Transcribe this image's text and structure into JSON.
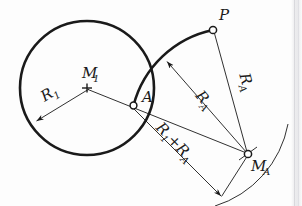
{
  "diagram": {
    "background_color": "#fdfdfd",
    "ink_color": "#1a1a1a",
    "labels": {
      "center_circle": {
        "base": "M",
        "sub": "1"
      },
      "radius_circle": {
        "base": "R",
        "sub": "1"
      },
      "point_tangency": {
        "base": "A",
        "sub": ""
      },
      "point_target": {
        "base": "P",
        "sub": ""
      },
      "center_arc": {
        "base": "M",
        "sub": "A"
      },
      "radius_arc_1": {
        "base": "R",
        "sub": "A"
      },
      "radius_arc_2": {
        "base": "R",
        "sub": "A"
      },
      "sum_radius": {
        "part1_base": "R",
        "part1_sub": "1",
        "operator": "+",
        "part2_base": "R",
        "part2_sub": "A"
      }
    },
    "geometry": {
      "circle": {
        "cx": 87,
        "cy": 88,
        "r": 67,
        "stroke_width": 2.6
      },
      "center_marker": {
        "x": 87,
        "y": 88
      },
      "point_a": {
        "x": 133.5,
        "y": 105.5,
        "r": 3.4
      },
      "point_p": {
        "x": 213,
        "y": 30,
        "r": 3.6
      },
      "point_ma": {
        "x": 248,
        "y": 154,
        "r": 3.6
      },
      "arc_tangent": {
        "start_x": 133.5,
        "start_y": 105.5,
        "end_x": 213,
        "end_y": 30,
        "radius": 104,
        "stroke_width": 2.6
      },
      "construction_arc": {
        "start_x": 286,
        "start_y": 126,
        "end_x": 218,
        "end_y": 206,
        "radius": 104,
        "stroke_width": 1.0
      },
      "radius_line_r1": {
        "x1": 87,
        "y1": 88,
        "x2": 35,
        "y2": 122
      },
      "radius_line_ra_arc": {
        "x1": 168,
        "y1": 62,
        "x2": 248,
        "y2": 154
      },
      "radius_line_ra_point": {
        "x1": 213,
        "y1": 30,
        "x2": 248,
        "y2": 154
      },
      "dimension_line": {
        "x1": 87,
        "y1": 88,
        "x2": 248,
        "y2": 154
      },
      "dimension_offset_line": {
        "x1": 133.5,
        "y1": 105.5,
        "x2": 222,
        "y2": 196
      },
      "closing_line": {
        "x1": 222,
        "y1": 196,
        "x2": 248,
        "y2": 154
      },
      "label_rotations": {
        "radius_arc_1_deg": 49,
        "radius_arc_2_deg": 74,
        "sum_radius_deg": 46
      }
    }
  }
}
